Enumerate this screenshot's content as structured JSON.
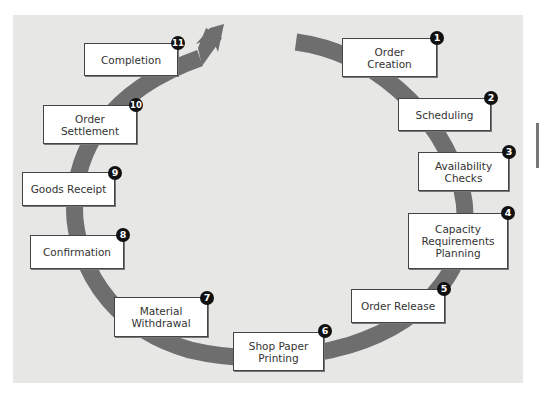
{
  "diagram": {
    "type": "cycle",
    "background_color": "#e7e7e6",
    "arc_color": "#6e6e6e",
    "badge_color": "#111111",
    "steps": [
      {
        "number": "1",
        "label": "Order\nCreation"
      },
      {
        "number": "2",
        "label": "Scheduling"
      },
      {
        "number": "3",
        "label": "Availability\nChecks"
      },
      {
        "number": "4",
        "label": "Capacity\nRequirements\nPlanning"
      },
      {
        "number": "5",
        "label": "Order Release"
      },
      {
        "number": "6",
        "label": "Shop Paper\nPrinting"
      },
      {
        "number": "7",
        "label": "Material\nWithdrawal"
      },
      {
        "number": "8",
        "label": "Confirmation"
      },
      {
        "number": "9",
        "label": "Goods Receipt"
      },
      {
        "number": "10",
        "label": "Order\nSettlement"
      },
      {
        "number": "11",
        "label": "Completion"
      }
    ]
  }
}
